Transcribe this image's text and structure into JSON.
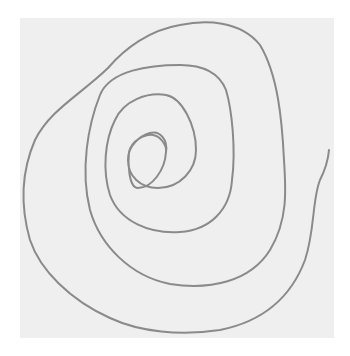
{
  "image": {
    "subject": "hand-drawn spiral",
    "paper_color": "#efefef",
    "line_color": "#8a8a8a",
    "background_color": "#ffffff"
  }
}
